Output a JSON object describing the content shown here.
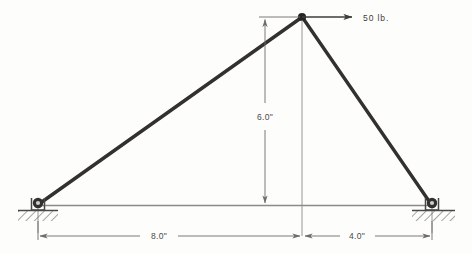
{
  "figure": {
    "background_color": "#fdfdfc"
  },
  "colors": {
    "member": "#33312f",
    "dimension_line": "#6e6c6a",
    "chord": "#8b8a88",
    "ground_hatch": "#5a5856",
    "text": "#4a4a4a",
    "joint": "#262524"
  },
  "load": {
    "label": "50 lb.",
    "direction": "right",
    "arrow_name": "force-arrow"
  },
  "dimensions": {
    "height": {
      "label": "6.0\"",
      "orientation": "vertical"
    },
    "left_span": {
      "label": "8.0\"",
      "orientation": "horizontal"
    },
    "right_span": {
      "label": "4.0\"",
      "orientation": "horizontal"
    }
  },
  "supports": {
    "left": {
      "type": "pin-support",
      "label": ""
    },
    "right": {
      "type": "pin-support",
      "label": ""
    }
  },
  "geometry": {
    "apex": {
      "x": 302,
      "y": 17
    },
    "left_support": {
      "x": 38,
      "y": 205
    },
    "right_support": {
      "x": 432,
      "y": 205
    }
  }
}
